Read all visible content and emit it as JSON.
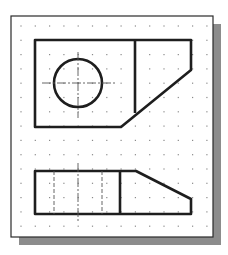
{
  "drawing": {
    "type": "orthographic-projection",
    "views": [
      "top-view",
      "front-view"
    ],
    "colors": {
      "background": "#ffffff",
      "paper": "#ffffff",
      "border": "#2a2a2a",
      "shadow": "#8c8c8c",
      "grid_dot": "#8a8a8a",
      "object_line": "#1e1e1e",
      "center_line": "#555555",
      "hidden_line": "#555555"
    },
    "frame": {
      "x": 11,
      "y": 16,
      "width": 202,
      "height": 221
    },
    "shadow": {
      "offset_x": 8,
      "offset_y": 8
    },
    "grid": {
      "start_x": 21,
      "start_y": 26,
      "spacing": 14.3,
      "cols": 14,
      "rows": 15
    },
    "top_view": {
      "outline": [
        [
          35,
          40
        ],
        [
          191,
          40
        ],
        [
          191,
          70
        ],
        [
          121,
          127
        ],
        [
          35,
          127
        ]
      ],
      "divider": [
        [
          135,
          40
        ],
        [
          135,
          113
        ]
      ],
      "circle": {
        "cx": 78,
        "cy": 83,
        "r": 24
      },
      "center_h": [
        [
          42,
          83
        ],
        [
          115,
          83
        ]
      ],
      "center_v": [
        [
          78,
          52
        ],
        [
          78,
          118
        ]
      ]
    },
    "front_view": {
      "outline": [
        [
          35,
          171
        ],
        [
          136,
          171
        ],
        [
          191,
          199
        ],
        [
          191,
          214
        ],
        [
          35,
          214
        ]
      ],
      "divider": [
        [
          120,
          171
        ],
        [
          120,
          214
        ]
      ],
      "hidden_lines": [
        [
          [
            54,
            171
          ],
          [
            54,
            214
          ]
        ],
        [
          [
            102,
            171
          ],
          [
            102,
            214
          ]
        ]
      ],
      "center_v": [
        [
          78,
          163
        ],
        [
          78,
          221
        ]
      ]
    }
  }
}
